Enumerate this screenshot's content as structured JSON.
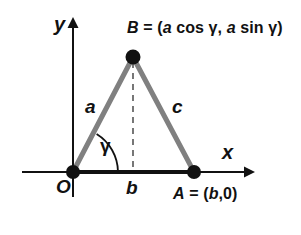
{
  "figure": {
    "kind": "geometry-diagram",
    "background_color": "#ffffff"
  },
  "axes": {
    "x_label": "x",
    "y_label": "y",
    "origin_label": "O",
    "axis_color": "#111111",
    "x_axis": {
      "y": 172,
      "x_start": 22,
      "x_end": 250
    },
    "y_axis": {
      "x": 73,
      "y_start": 22,
      "y_end": 197
    }
  },
  "points": {
    "origin": {
      "name": "O",
      "x": 73,
      "y": 172
    },
    "a": {
      "name": "A",
      "label": "A = (b,0)",
      "x": 194,
      "y": 172
    },
    "b": {
      "name": "B",
      "label": "B = (a cos γ, a sin γ)",
      "x": 133,
      "y": 57
    }
  },
  "sides": {
    "a": {
      "label": "a",
      "from": "O",
      "to": "B",
      "color": "#808080"
    },
    "c": {
      "label": "c",
      "from": "B",
      "to": "A",
      "color": "#808080"
    },
    "b": {
      "label": "b",
      "from": "O",
      "to": "A",
      "color": "#111111"
    }
  },
  "angle": {
    "label": "γ",
    "vertex": "O",
    "arc_color": "#111111"
  },
  "dashed_line": {
    "from_point": "B",
    "to_x_axis": true,
    "color": "#555555",
    "style": "dashed"
  },
  "point_b_label_parts": {
    "name": "B",
    "equals": " = (",
    "a1": "a",
    "cos": " cos ",
    "gamma1": "γ",
    "comma": ", ",
    "a2": "a",
    "sin": " sin ",
    "gamma2": "γ",
    "close": ")"
  },
  "point_a_label_parts": {
    "name": "A",
    "equals": " = (",
    "b": "b",
    "rest": ",0)"
  }
}
